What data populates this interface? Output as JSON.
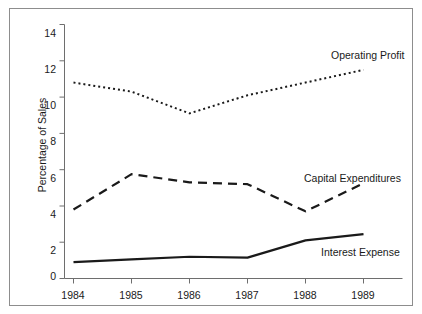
{
  "chart_data": {
    "type": "line",
    "title": "",
    "subtitle": "",
    "xlabel": "",
    "ylabel": "Percentage of Sales",
    "categories": [
      "1984",
      "1985",
      "1986",
      "1987",
      "1988",
      "1989"
    ],
    "x": [
      1984,
      1985,
      1986,
      1987,
      1988,
      1989
    ],
    "ylim": [
      0,
      14
    ],
    "yticks": [
      0,
      2,
      4,
      6,
      8,
      10,
      12,
      14
    ],
    "ytick_labels": [
      "0",
      "2",
      "4",
      "6",
      "8",
      "10",
      "12",
      "14"
    ],
    "xtick_labels": [
      "1984",
      "1985",
      "1986",
      "1987",
      "1988",
      "1989"
    ],
    "grid": false,
    "legend_position": "inline-right",
    "series": [
      {
        "name": "Operating Profit",
        "style": "dotted",
        "color": "#1a1a1a",
        "label_x": 1989,
        "values": [
          10.8,
          10.3,
          9.1,
          10.1,
          10.8,
          11.5
        ]
      },
      {
        "name": "Capital Expenditures",
        "style": "dashed",
        "color": "#1a1a1a",
        "label_x": 1989,
        "values": [
          3.8,
          5.75,
          5.3,
          5.2,
          3.7,
          5.25
        ]
      },
      {
        "name": "Interest Expense",
        "style": "solid",
        "color": "#1a1a1a",
        "label_x": 1989,
        "values": [
          0.9,
          1.05,
          1.2,
          1.15,
          2.1,
          2.45
        ]
      }
    ],
    "annotations": [
      {
        "text": "Operating Profit",
        "x": 330,
        "y": 48
      },
      {
        "text": "Capital Expenditures",
        "x": 303,
        "y": 171
      },
      {
        "text": "Interest Expense",
        "x": 320,
        "y": 245
      }
    ],
    "colors": {
      "axis": "#6e6e6e",
      "frame": "#8d8d8d",
      "text": "#1a1a1a",
      "series": "#1a1a1a",
      "background": "#ffffff"
    }
  }
}
